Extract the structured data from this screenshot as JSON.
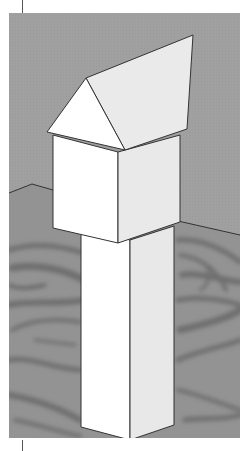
{
  "viewport": {
    "label": "3D model viewport",
    "sky_color": "#9e9e9e",
    "ground_color": "#939393",
    "ground_pattern_color": "#6a6a6a",
    "edge_color": "#333333"
  },
  "model": {
    "name": "tower",
    "parts": [
      {
        "name": "gable-roof",
        "faces": [
          "roof-front-gable",
          "roof-slope"
        ]
      },
      {
        "name": "box-body",
        "faces": [
          "box-left-face",
          "box-right-face"
        ]
      },
      {
        "name": "column",
        "faces": [
          "column-left-face",
          "column-right-face"
        ]
      }
    ],
    "face_colors": {
      "lit": "#ffffff",
      "shaded": "#e9e9e9"
    }
  },
  "crop_marks": {
    "x": 22,
    "top": [
      0,
      13
    ],
    "bottom": [
      440,
      451
    ]
  }
}
